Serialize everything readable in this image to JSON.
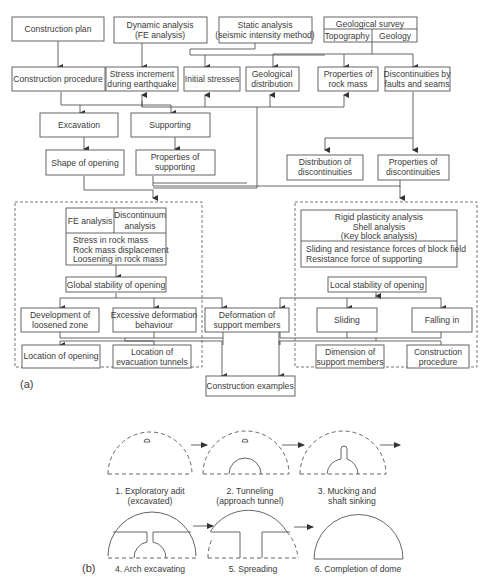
{
  "part_a": {
    "label": "(a)",
    "nodes": {
      "construction_plan": "Construction plan",
      "dynamic_analysis": [
        "Dynamic analysis",
        "(FE analysis)"
      ],
      "static_analysis": [
        "Static analysis",
        "(seismic intensity method)"
      ],
      "geological_survey": "Geological survey",
      "topography": "Topography",
      "geology": "Geology",
      "construction_procedure": "Construction procedure",
      "stress_increment": [
        "Stress increment",
        "during earthquake"
      ],
      "initial_stresses": "Initial stresses",
      "geological_distribution": [
        "Geological",
        "distribution"
      ],
      "properties_rock_mass": [
        "Properties of",
        "rock mass"
      ],
      "discontinuities_faults": [
        "Discontinuities by",
        "faults and seams"
      ],
      "excavation": "Excavation",
      "supporting": "Supporting",
      "shape_of_opening": "Shape of opening",
      "properties_supporting": [
        "Properties of",
        "supporting"
      ],
      "distribution_discontinuities": [
        "Distribution of",
        "discontinuities"
      ],
      "properties_discontinuities": [
        "Properties of",
        "discontinuities"
      ],
      "fe_analysis": "FE analysis",
      "discontinuum_analysis": [
        "Discontinuum",
        "analysis"
      ],
      "rock_mass_effects": [
        "Stress in rock mass",
        "Rock mass displacement",
        "Loosening in rock mass"
      ],
      "global_stability": "Global stability of opening",
      "development_loosened": [
        "Development of",
        "loosened zone"
      ],
      "excessive_deformation": [
        "Excessive deformation",
        "behaviour"
      ],
      "deformation_support": [
        "Deformation of",
        "support members"
      ],
      "location_opening": "Location of opening",
      "location_evacuation": [
        "Location of",
        "evacuation tunnels"
      ],
      "construction_examples": "Construction examples",
      "rigid_analyses": [
        "Rigid plasticity analysis",
        "Shell analysis",
        "(Key block analysis)"
      ],
      "block_forces": [
        "Sliding and resistance forces of block field",
        "Resistance force of supporting"
      ],
      "local_stability": "Local stability of opening",
      "sliding": "Sliding",
      "falling_in": "Falling in",
      "dimension_support": [
        "Dimension of",
        "support members"
      ],
      "construction_procedure_2": [
        "Construction",
        "procedure"
      ]
    }
  },
  "part_b": {
    "label": "(b)",
    "steps": [
      [
        "1.  Exploratory adit",
        "(excavated)"
      ],
      [
        "2.  Tunneling",
        "(approach tunnel)"
      ],
      [
        "3.  Mucking and",
        "shaft sinking"
      ],
      [
        "4.  Arch excavating"
      ],
      [
        "5.  Spreading"
      ],
      [
        "6. Completion of dome"
      ]
    ]
  }
}
